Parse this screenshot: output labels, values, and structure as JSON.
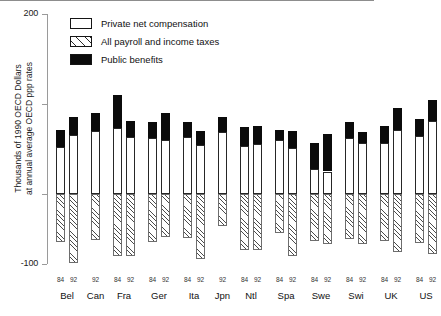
{
  "chart_data": {
    "type": "bar",
    "title": "",
    "xlabel": "",
    "ylabel": "Thousands of 1990 OECD Dollars\nat annual average OECD ppp rates",
    "ylim": [
      -100,
      200
    ],
    "yticks": [
      200,
      100,
      0,
      -100
    ],
    "ytick_labels": [
      "200",
      "",
      "",
      "-100"
    ],
    "grid": false,
    "stacked": true,
    "legend_position": "upper-left-inside",
    "legend": [
      {
        "key": "private_net_compensation",
        "label": "Private net compensation",
        "style": "white"
      },
      {
        "key": "payroll_income_taxes",
        "label": "All payroll and income taxes",
        "style": "hatch"
      },
      {
        "key": "public_benefits",
        "label": "Public benefits",
        "style": "black"
      }
    ],
    "categories": [
      "Bel",
      "Can",
      "Fra",
      "Ger",
      "Ita",
      "Jpn",
      "Ntl",
      "Spa",
      "Swe",
      "Swi",
      "UK",
      "US"
    ],
    "bars": [
      {
        "group": "Bel",
        "year": "84",
        "private": 52,
        "benefits": 19,
        "taxes": -68
      },
      {
        "group": "Bel",
        "year": "92",
        "private": 66,
        "benefits": 20,
        "taxes": -98
      },
      {
        "group": "Can",
        "year": "92",
        "private": 70,
        "benefits": 20,
        "taxes": -66
      },
      {
        "group": "Fra",
        "year": "84",
        "private": 73,
        "benefits": 37,
        "taxes": -89
      },
      {
        "group": "Fra",
        "year": "92",
        "private": 63,
        "benefits": 18,
        "taxes": -89
      },
      {
        "group": "Ger",
        "year": "84",
        "private": 62,
        "benefits": 18,
        "taxes": -68
      },
      {
        "group": "Ger",
        "year": "92",
        "private": 60,
        "benefits": 30,
        "taxes": -62
      },
      {
        "group": "Ita",
        "year": "84",
        "private": 63,
        "benefits": 17,
        "taxes": -63
      },
      {
        "group": "Ita",
        "year": "92",
        "private": 55,
        "benefits": 15,
        "taxes": -93
      },
      {
        "group": "Jpn",
        "year": "92",
        "private": 69,
        "benefits": 17,
        "taxes": -46
      },
      {
        "group": "Ntl",
        "year": "84",
        "private": 53,
        "benefits": 22,
        "taxes": -80
      },
      {
        "group": "Ntl",
        "year": "92",
        "private": 56,
        "benefits": 20,
        "taxes": -80
      },
      {
        "group": "Spa",
        "year": "84",
        "private": 60,
        "benefits": 11,
        "taxes": -56
      },
      {
        "group": "Spa",
        "year": "92",
        "private": 51,
        "benefits": 19,
        "taxes": -88
      },
      {
        "group": "Swe",
        "year": "84",
        "private": 28,
        "benefits": 29,
        "taxes": -67
      },
      {
        "group": "Swe",
        "year": "92",
        "private": 25,
        "benefits": 42,
        "taxes": -72
      },
      {
        "group": "Swi",
        "year": "84",
        "private": 62,
        "benefits": 18,
        "taxes": -64
      },
      {
        "group": "Swi",
        "year": "92",
        "private": 57,
        "benefits": 12,
        "taxes": -72
      },
      {
        "group": "UK",
        "year": "84",
        "private": 57,
        "benefits": 19,
        "taxes": -67
      },
      {
        "group": "UK",
        "year": "92",
        "private": 71,
        "benefits": 25,
        "taxes": -83
      },
      {
        "group": "US",
        "year": "84",
        "private": 64,
        "benefits": 19,
        "taxes": -70
      },
      {
        "group": "US",
        "year": "92",
        "private": 81,
        "benefits": 23,
        "taxes": -85
      }
    ]
  }
}
